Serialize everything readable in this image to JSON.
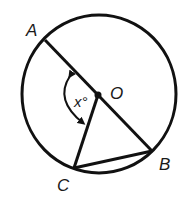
{
  "diagram": {
    "type": "circle-geometry",
    "colors": {
      "stroke": "#111111",
      "text": "#1a1a1a",
      "background": "#ffffff"
    },
    "circle": {
      "center_label": "O"
    },
    "points": {
      "A": "A",
      "B": "B",
      "C": "C",
      "O": "O"
    },
    "segments": [
      "AB (diameter through O)",
      "OC",
      "CB"
    ],
    "angle": {
      "label": "x°",
      "between": "OA and OC",
      "vertex": "O"
    }
  }
}
